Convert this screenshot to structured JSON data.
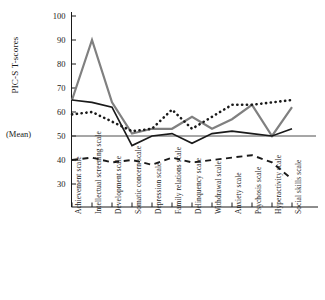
{
  "chart_data": {
    "type": "line",
    "title": "",
    "xlabel": "",
    "ylabel": "PIC-S T-scores",
    "mean_label": "(Mean)",
    "mean_value": 50,
    "ylim": [
      20,
      103
    ],
    "yticks": [
      30,
      40,
      50,
      60,
      70,
      80,
      90,
      100
    ],
    "grid": false,
    "legend_position": "none",
    "categories": [
      "Achievement scale",
      "Intellectual screening scale",
      "Development scale",
      "Somatic concern scale",
      "Depression scale",
      "Family relations scale",
      "Delinquency scale",
      "Withdrawal scale",
      "Anxiety scale",
      "Psychosis scale",
      "Hyperactivity scale",
      "Social skills scale"
    ],
    "series": [
      {
        "name": "gray-solid-line",
        "style": "solid",
        "color": "#808080",
        "width": 2.2,
        "values": [
          65,
          90,
          64,
          51,
          53,
          53,
          58,
          53,
          57,
          63,
          50,
          62
        ]
      },
      {
        "name": "black-solid-line",
        "style": "solid",
        "color": "#1a1a1a",
        "width": 1.7,
        "values": [
          65,
          64,
          62,
          46,
          50,
          51,
          47,
          51,
          52,
          51,
          50,
          53
        ]
      },
      {
        "name": "black-dotted-line",
        "style": "dotted",
        "color": "#1a1a1a",
        "width": 2.6,
        "values": [
          59,
          60,
          56,
          52,
          53,
          61,
          53,
          58,
          63,
          63,
          64,
          65
        ]
      },
      {
        "name": "black-dashed-line",
        "style": "dashed",
        "color": "#1a1a1a",
        "width": 1.9,
        "values": [
          40,
          41,
          39,
          40,
          38,
          41,
          39,
          40,
          41,
          42,
          39,
          32
        ]
      }
    ]
  }
}
